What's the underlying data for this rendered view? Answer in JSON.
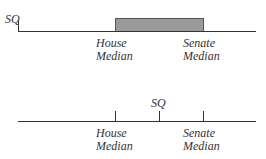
{
  "panels": [
    {
      "id": "top",
      "sq_label": "SQ",
      "house_label_1": "House",
      "house_label_2": "Median",
      "senate_label_1": "Senate",
      "senate_label_2": "Median",
      "shaded_interval": [
        "House Median",
        "Senate Median"
      ]
    },
    {
      "id": "bottom",
      "sq_label": "SQ",
      "house_label_1": "House",
      "house_label_2": "Median",
      "senate_label_1": "Senate",
      "senate_label_2": "Median"
    }
  ],
  "colors": {
    "line": "#333333",
    "shaded": "#9a9a9a"
  }
}
